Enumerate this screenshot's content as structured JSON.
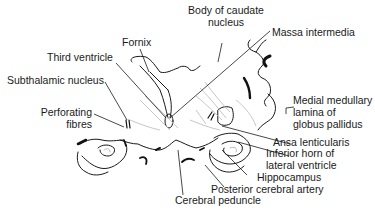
{
  "figure": {
    "labels": {
      "fornix": "Fornix",
      "body_caudate_1": "Body of caudate",
      "body_caudate_2": "nucleus",
      "massa_intermedia": "Massa intermedia",
      "third_ventricle": "Third ventricle",
      "subthalamic_nucleus": "Subthalamic nucleus",
      "perforating_1": "Perforating",
      "perforating_2": "fibres",
      "medial_lamina_1": "Medial medullary",
      "medial_lamina_2": "lamina of",
      "medial_lamina_3": "globus pallidus",
      "ansa_lenticularis": "Ansa lenticularis",
      "inferior_horn_1": "Inferior horn of",
      "inferior_horn_2": "lateral ventricle",
      "hippocampus": "Hippocampus",
      "posterior_cerebral_artery": "Posterior cerebral artery",
      "cerebral_peduncle": "Cerebral peduncle"
    },
    "colors": {
      "line": "#1a1a1a",
      "faint": "#b8b8b8",
      "fill": "#111111"
    }
  }
}
